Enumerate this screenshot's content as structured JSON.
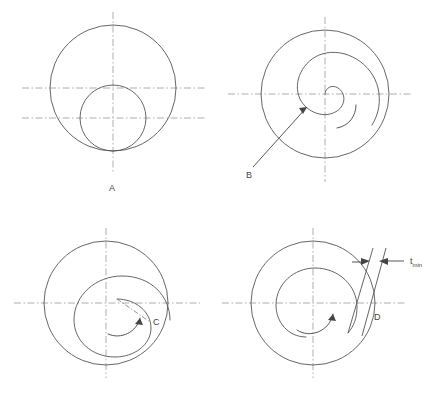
{
  "figure": {
    "type": "technical-line-diagram",
    "background": "#ffffff",
    "stroke_circle": "#555555",
    "stroke_centerline": "#9a9a9a",
    "stroke_arrow": "#444444",
    "label_color": "#444444",
    "caption_color": "#f2f2f2"
  },
  "panels": [
    {
      "id": "A",
      "label": "A",
      "label_x": 112,
      "label_y": 191,
      "center_x": 113,
      "center_y": 88,
      "outer_r": 63,
      "inner_r": 33,
      "inner_cx": 113,
      "inner_cy": 118,
      "vline_x": 113,
      "vline_y1": 12,
      "vline_y2": 172,
      "hline1_y": 88,
      "hline2_y": 118,
      "hline_x1": 22,
      "hline_x2": 206,
      "has_spiral": false,
      "has_rotation_arrow": false,
      "has_leader": false
    },
    {
      "id": "B",
      "label": "B",
      "label_x": 249,
      "label_y": 178,
      "center_x": 325,
      "center_y": 94,
      "outer_r": 64,
      "vline_x": 325,
      "vline_y1": 17,
      "vline_y2": 182,
      "hline_y": 94,
      "hline_x1": 228,
      "hline_x2": 411,
      "has_spiral": true,
      "spiral_turns": 1.75,
      "spiral_r_end": 64,
      "has_rotation_arrow": true,
      "has_leader": true,
      "leader_x1": 253,
      "leader_y1": 167,
      "leader_x2": 307,
      "leader_y2": 107
    },
    {
      "id": "C",
      "label": "C",
      "label_x": 153,
      "label_y": 325,
      "center_x": 106,
      "center_y": 303,
      "outer_r": 62,
      "inner_r": 35,
      "inner_cx": 117,
      "inner_cy": 299,
      "vline_x": 106,
      "vline_y1": 228,
      "vline_y2": 378,
      "hline_y": 303,
      "hline_x1": 14,
      "hline_x2": 200,
      "has_spiral": true,
      "has_rotation_arrow": true,
      "has_leader": true,
      "leader_x1": 117,
      "leader_y1": 299,
      "leader_x2": 150,
      "leader_y2": 322
    },
    {
      "id": "D",
      "label": "D",
      "label_x": 374,
      "label_y": 317,
      "center_x": 313,
      "center_y": 303,
      "outer_r": 62,
      "inner_r": 35,
      "vline_x": 313,
      "vline_y1": 228,
      "vline_y2": 378,
      "hline_y": 303,
      "hline_x1": 222,
      "hline_x2": 406,
      "has_spiral": true,
      "has_rotation_arrow": true,
      "has_leader": false,
      "has_thickness_callout": true
    }
  ],
  "annotations": {
    "thickness_symbol": "t",
    "thickness_subscript": "min",
    "thickness_label_x": 412,
    "thickness_label_y": 262
  },
  "caption": {
    "text": ""
  }
}
